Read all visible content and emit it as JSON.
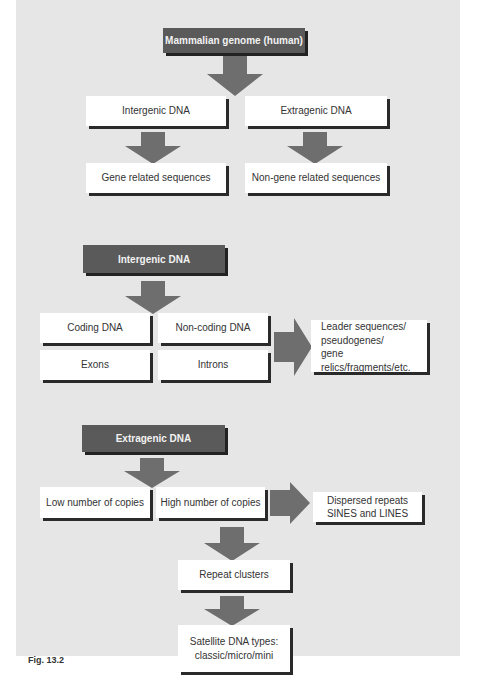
{
  "figure": {
    "label": "Fig. 13.2",
    "colors": {
      "background": "#e6e6e6",
      "header": "#5a5a5a",
      "arrow": "#6e6e6e",
      "box": "#ffffff",
      "shadow": "#2a2a2a"
    }
  },
  "section1": {
    "root": "Mammalian genome (human)",
    "level1": [
      "Intergenic DNA",
      "Extragenic DNA"
    ],
    "level2": [
      "Gene related sequences",
      "Non-gene related sequences"
    ]
  },
  "section2": {
    "header": "Intergenic DNA",
    "grid": [
      "Coding DNA",
      "Non-coding DNA",
      "Exons",
      "Introns"
    ],
    "side": [
      "Leader sequences/",
      "pseudogenes/",
      "gene relics/fragments/etc."
    ]
  },
  "section3": {
    "header": "Extragenic DNA",
    "row": [
      "Low number of  copies",
      "High number of copies"
    ],
    "side": [
      "Dispersed repeats",
      "SINES and LINES"
    ],
    "clusters": "Repeat clusters",
    "satellite": [
      "Satellite DNA types:",
      "classic/micro/mini"
    ]
  }
}
